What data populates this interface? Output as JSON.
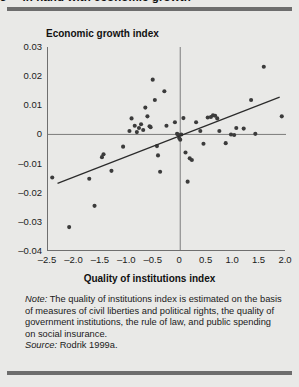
{
  "figure": {
    "number": "3",
    "title": "in hand with economic growth",
    "title_full": "3  ... in hand with economic growth"
  },
  "notes": {
    "note_label": "Note:",
    "note_text": " The quality of institutions index is estimated on the basis of measures of civil liberties and political rights, the quality of government institutions, the rule of law, and public spending on social insurance.",
    "source_label": "Source:",
    "source_text": " Rodrik 1999a."
  },
  "colors": {
    "page_background": "#e9e9e7",
    "rule": "#6d6d6d",
    "axis": "#6f6f6f",
    "point": "#3b3b3b",
    "trendline": "#2b2b2b"
  },
  "chart_data": {
    "type": "scatter",
    "title": "Economic growth index",
    "xlabel": "Quality of institutions index",
    "ylabel": "Economic growth index",
    "xlim": [
      -2.5,
      2.0
    ],
    "ylim": [
      -0.04,
      0.03
    ],
    "xticks": [
      -2.5,
      -2.0,
      -1.5,
      -1.0,
      -0.5,
      0,
      0.5,
      1.0,
      1.5,
      2.0
    ],
    "xticklabels": [
      "–2.5",
      "–2.0",
      "–1.5",
      "–1.0",
      "–0.5",
      "0",
      "0.5",
      "1.0",
      "1.5",
      "2.0"
    ],
    "yticks": [
      0.03,
      0.02,
      0.01,
      0,
      -0.01,
      -0.02,
      -0.03,
      -0.04
    ],
    "yticklabels": [
      "0.03",
      "0.02",
      "0.01",
      "0",
      "–0.01",
      "–0.02",
      "–0.03",
      "–0.04"
    ],
    "grid": false,
    "zero_lines": {
      "x": 0,
      "y": 0
    },
    "legend": null,
    "trendline": {
      "name": "fitted regression line",
      "x": [
        -2.32,
        1.88
      ],
      "y": [
        -0.0168,
        0.0128
      ]
    },
    "points": [
      {
        "x": -2.42,
        "y": -0.0148
      },
      {
        "x": -2.1,
        "y": -0.0318
      },
      {
        "x": -1.72,
        "y": -0.0152
      },
      {
        "x": -1.62,
        "y": -0.0245
      },
      {
        "x": -1.48,
        "y": -0.0078
      },
      {
        "x": -1.45,
        "y": -0.0068
      },
      {
        "x": -1.3,
        "y": -0.0125
      },
      {
        "x": -1.08,
        "y": -0.0042
      },
      {
        "x": -0.96,
        "y": 0.0012
      },
      {
        "x": -0.92,
        "y": 0.0055
      },
      {
        "x": -0.86,
        "y": 0.003
      },
      {
        "x": -0.82,
        "y": 0.0008
      },
      {
        "x": -0.78,
        "y": 0.0022
      },
      {
        "x": -0.74,
        "y": 0.0035
      },
      {
        "x": -0.7,
        "y": 0.0015
      },
      {
        "x": -0.66,
        "y": 0.0092
      },
      {
        "x": -0.62,
        "y": 0.0062
      },
      {
        "x": -0.58,
        "y": 0.0028
      },
      {
        "x": -0.56,
        "y": 0.0025
      },
      {
        "x": -0.52,
        "y": 0.0188
      },
      {
        "x": -0.48,
        "y": 0.0118
      },
      {
        "x": -0.44,
        "y": -0.004
      },
      {
        "x": -0.42,
        "y": -0.0072
      },
      {
        "x": -0.38,
        "y": -0.0128
      },
      {
        "x": -0.3,
        "y": 0.0148
      },
      {
        "x": -0.26,
        "y": 0.003
      },
      {
        "x": -0.1,
        "y": 0.0042
      },
      {
        "x": -0.06,
        "y": 0.0002
      },
      {
        "x": -0.04,
        "y": 0.0
      },
      {
        "x": -0.02,
        "y": -0.0012
      },
      {
        "x": 0.0,
        "y": -0.0018
      },
      {
        "x": 0.02,
        "y": 0.0
      },
      {
        "x": 0.06,
        "y": 0.0056
      },
      {
        "x": 0.1,
        "y": -0.0062
      },
      {
        "x": 0.14,
        "y": -0.0162
      },
      {
        "x": 0.18,
        "y": -0.0082
      },
      {
        "x": 0.22,
        "y": -0.0088
      },
      {
        "x": 0.3,
        "y": 0.0042
      },
      {
        "x": 0.38,
        "y": 0.0012
      },
      {
        "x": 0.44,
        "y": -0.0032
      },
      {
        "x": 0.52,
        "y": 0.0058
      },
      {
        "x": 0.58,
        "y": 0.006
      },
      {
        "x": 0.62,
        "y": 0.0066
      },
      {
        "x": 0.66,
        "y": 0.0064
      },
      {
        "x": 0.7,
        "y": 0.0055
      },
      {
        "x": 0.74,
        "y": 0.0012
      },
      {
        "x": 0.86,
        "y": -0.003
      },
      {
        "x": 0.96,
        "y": 0.0
      },
      {
        "x": 1.02,
        "y": -0.0002
      },
      {
        "x": 1.06,
        "y": 0.0022
      },
      {
        "x": 1.2,
        "y": 0.002
      },
      {
        "x": 1.34,
        "y": 0.0118
      },
      {
        "x": 1.42,
        "y": 0.0002
      },
      {
        "x": 1.58,
        "y": 0.0232
      },
      {
        "x": 1.92,
        "y": 0.0062
      }
    ]
  }
}
